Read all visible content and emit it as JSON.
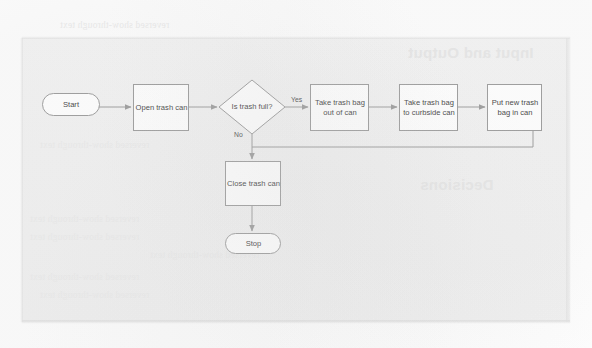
{
  "document": {
    "kind": "scanned-book-page",
    "figure_title": "Trash disposal flowchart"
  },
  "flowchart": {
    "nodes": [
      {
        "id": "start",
        "shape": "terminator",
        "label": "Start"
      },
      {
        "id": "open",
        "shape": "process",
        "label": "Open trash can"
      },
      {
        "id": "decision",
        "shape": "decision",
        "label": "Is trash full?"
      },
      {
        "id": "takeout",
        "shape": "process",
        "label": "Take trash bag out of can"
      },
      {
        "id": "curbside",
        "shape": "process",
        "label": "Take trash bag to curbside can"
      },
      {
        "id": "putnew",
        "shape": "process",
        "label": "Put new trash bag in can"
      },
      {
        "id": "close",
        "shape": "process",
        "label": "Close trash can"
      },
      {
        "id": "stop",
        "shape": "terminator",
        "label": "Stop"
      }
    ],
    "edge_labels": {
      "yes": "Yes",
      "no": "No"
    },
    "colors": {
      "stroke": "#9a9a9a",
      "node_fill": "#ffffff",
      "text": "#3d3d3d",
      "page": "#f1f1f1"
    }
  },
  "background_showthrough": {
    "heading_top_right": "Input and Output",
    "heading_mid_right": "Decisions",
    "line_top": "reversed show-through text",
    "line_mid": "reversed show-through text",
    "lines_bottom": [
      "reversed show-through text",
      "reversed show-through text",
      "reversed show-through text",
      "reversed show-through text",
      "reversed show-through text"
    ]
  }
}
